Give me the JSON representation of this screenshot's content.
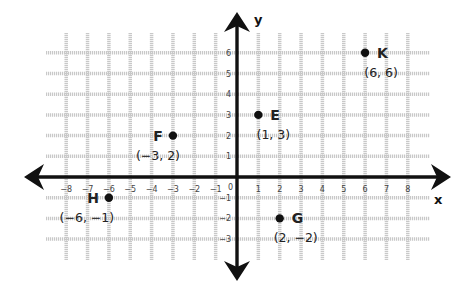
{
  "chart_data": {
    "type": "scatter",
    "title": "",
    "xlabel": "x",
    "ylabel": "y",
    "xlim": [
      -8,
      8
    ],
    "ylim": [
      -3,
      6
    ],
    "grid": true,
    "x_ticks": [
      "-8",
      "-7",
      "-6",
      "-5",
      "-4",
      "-3",
      "-2",
      "-1",
      "1",
      "2",
      "3",
      "4",
      "5",
      "6",
      "7",
      "8"
    ],
    "y_ticks": [
      "6",
      "5",
      "4",
      "3",
      "2",
      "1",
      "-1",
      "-2",
      "-3"
    ],
    "origin_label": "0",
    "points": [
      {
        "name": "E",
        "x": 1,
        "y": 3,
        "label": "(1, 3)"
      },
      {
        "name": "F",
        "x": -3,
        "y": 2,
        "label": "(−3, 2)"
      },
      {
        "name": "G",
        "x": 2,
        "y": -2,
        "label": "(2, −2)"
      },
      {
        "name": "H",
        "x": -6,
        "y": -1,
        "label": "(−6, −1)"
      },
      {
        "name": "K",
        "x": 6,
        "y": 6,
        "label": "(6, 6)"
      }
    ]
  },
  "colors": {
    "axis": "#111111",
    "grid": "#c8c8c8",
    "point": "#111111"
  }
}
